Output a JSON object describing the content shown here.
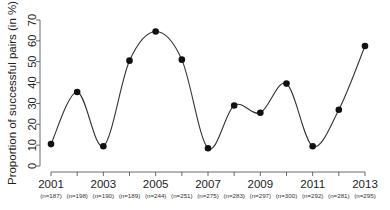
{
  "chart_data": {
    "type": "line",
    "title": "",
    "xlabel": "",
    "ylabel": "Proportion of successful pairs (in %)",
    "ylim": [
      0,
      70
    ],
    "yticks": [
      0,
      10,
      20,
      30,
      40,
      50,
      60,
      70
    ],
    "grid": false,
    "legend": null,
    "smoothed": true,
    "marker": "filled-circle",
    "x": [
      2001,
      2002,
      2003,
      2004,
      2005,
      2006,
      2007,
      2008,
      2009,
      2010,
      2011,
      2012,
      2013
    ],
    "x_year_labels": [
      "2001",
      "",
      "2003",
      "",
      "2005",
      "",
      "2007",
      "",
      "2009",
      "",
      "2011",
      "",
      "2013"
    ],
    "x_sample_labels": [
      "(n=187)",
      "(n=198)",
      "(n=190)",
      "(n=189)",
      "(n=244)",
      "(n=251)",
      "(n=275)",
      "(n=283)",
      "(n=297)",
      "(n=300)",
      "(n=292)",
      "(n=281)",
      "(n=295)"
    ],
    "series": [
      {
        "name": "Proportion of successful pairs",
        "values": [
          10.5,
          35.5,
          9.5,
          50.5,
          64.5,
          51,
          8.5,
          29,
          25.5,
          39.5,
          9.5,
          27,
          57.5
        ]
      }
    ],
    "colors": {
      "line": "#333333",
      "marker": "#111111",
      "axis": "#444444"
    }
  }
}
